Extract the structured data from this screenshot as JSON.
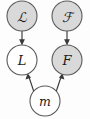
{
  "diagram": {
    "type": "directed-graphical-model",
    "background_color": "#fdfdfd",
    "stroke_color": "#3a3a3a",
    "shaded_fill": "#d9d9d9",
    "plain_fill": "#ffffff",
    "node_radius": 15,
    "nodes": [
      {
        "id": "script-L",
        "label": "ℒ",
        "shaded": true,
        "cx": 22,
        "cy": 16,
        "style": "script",
        "role": "latent-prior-L"
      },
      {
        "id": "script-F",
        "label": "ℱ",
        "shaded": true,
        "cx": 67,
        "cy": 16,
        "style": "script",
        "role": "latent-prior-F"
      },
      {
        "id": "L",
        "label": "L",
        "shaded": false,
        "cx": 22,
        "cy": 60,
        "style": "italic",
        "role": "variable-L"
      },
      {
        "id": "F",
        "label": "F",
        "shaded": true,
        "cx": 67,
        "cy": 60,
        "style": "italic",
        "role": "variable-F"
      },
      {
        "id": "m",
        "label": "m",
        "shaded": false,
        "cx": 45,
        "cy": 101,
        "style": "italic",
        "role": "variable-m"
      }
    ],
    "edges": [
      {
        "id": "edge-scriptL-to-L",
        "from": "script-L",
        "to": "L",
        "label": ""
      },
      {
        "id": "edge-scriptF-to-F",
        "from": "script-F",
        "to": "F",
        "label": ""
      },
      {
        "id": "edge-m-to-L",
        "from": "m",
        "to": "L",
        "label": ""
      },
      {
        "id": "edge-m-to-F",
        "from": "m",
        "to": "F",
        "label": ""
      }
    ]
  }
}
